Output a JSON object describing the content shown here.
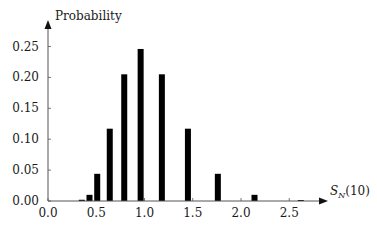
{
  "chart_data": {
    "type": "bar",
    "title": "",
    "ylabel": "Probability",
    "xlabel": "S_N(10)",
    "xlabel_main": "S",
    "xlabel_sub": "N",
    "xlabel_arg": "(10)",
    "xlim": [
      0.0,
      2.8
    ],
    "ylim": [
      0.0,
      0.27
    ],
    "grid": false,
    "legend": null,
    "x_ticks": [
      0.0,
      0.5,
      1.0,
      1.5,
      2.0,
      2.5
    ],
    "x_tick_labels": [
      "0.0",
      "0.5",
      "1.0",
      "1.5",
      "2.0",
      "2.5"
    ],
    "y_ticks": [
      0.0,
      0.05,
      0.1,
      0.15,
      0.2,
      0.25
    ],
    "y_tick_labels": [
      "0.00",
      "0.05",
      "0.10",
      "0.15",
      "0.20",
      "0.25"
    ],
    "x": [
      0.35,
      0.43,
      0.51,
      0.64,
      0.79,
      0.96,
      1.18,
      1.45,
      1.76,
      2.14,
      2.62
    ],
    "values": [
      0.002,
      0.01,
      0.044,
      0.117,
      0.205,
      0.246,
      0.205,
      0.117,
      0.044,
      0.01,
      0.001
    ],
    "bar_color": "#000000"
  }
}
